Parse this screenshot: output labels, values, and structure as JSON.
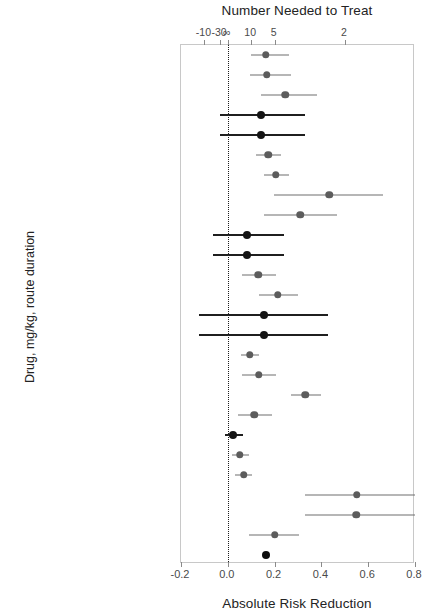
{
  "chart_data": {
    "type": "scatter",
    "subtype": "forest-plot",
    "title": "Number Needed to Treat",
    "xlabel": "Absolute Risk Reduction",
    "ylabel": "Drug, mg/kg, route duration",
    "top_axis_label": "Number Needed to Treat",
    "bottom_axis_label": "Absolute Risk Reduction",
    "xlim": [
      -0.2,
      0.8
    ],
    "bottom_ticks": [
      "-0.2",
      "0.0",
      "0.2",
      "0.4",
      "0.6",
      "0.8"
    ],
    "bottom_tick_values": [
      -0.2,
      0.0,
      0.2,
      0.4,
      0.6,
      0.8
    ],
    "top_ticks": [
      "-10",
      "-30",
      "∞",
      "10",
      "5",
      "2"
    ],
    "top_tick_values": [
      -0.1,
      -0.0333,
      0.0,
      0.1,
      0.2,
      0.5
    ],
    "grid": false,
    "legend": "none",
    "reference_line": 0.0,
    "reference_line_style": "dotted",
    "categories": [
      "Ceft Na, 2.2, IM 3 d (ET)",
      "Ceft Na, 1.1, IM 3 d (DRS1)",
      "Ceft Na, 2.2, IM 3 d (DRS1)",
      "Ceft Na, 1.1, IM 3 d (DRS2)",
      "Ceft Na, 2.2, IM 3 d (DRS2)",
      "Ceft Na, 1.1, IM 3 d (CT)",
      "Ceft Na, 2.2, IM 3 d (CT)",
      "Flor, 20, IM 48 h apart (ET)",
      "Flor, 20, IM 48 h apart (FS)",
      "Flor, 20, IM 48 h apart (DSSa)",
      "Flor, 40, SC once (DSSb)",
      "Flor, 40, SC once (DSSc)",
      "Flor, 40, SC once (DSSd)",
      "Enro, 2.5, SC daily 3-5 d (DRS)",
      "Enro, 5.0, SC daily 3-5 d (DRS)",
      "Enro, 2.5, SC daily 3-5 d (MLFS1)",
      "Enro, 5.0, SC daily 5 d (MLFS1)",
      "Enro, 7.5, SC once (MLFS2)",
      "Enro, 12.5, SC once (MLFS2)",
      "Dano, 6, IM 48 h apart (MLFS)",
      "Tula, 2.5, SC once (MLFS)",
      "Tild, 4, SC once (MLFS)",
      "Tula, 2.5, SC once (Kilgore et al)",
      "Til, 10, SC once (Kilgore et al)",
      "Flor, 20, IM 48 h apart (Booker et al)",
      "MEDIAN"
    ],
    "points": [
      {
        "label": "Ceft Na, 2.2, IM 3 d (ET)",
        "estimate": 0.163,
        "low": 0.1,
        "high": 0.262,
        "style": "grey"
      },
      {
        "label": "Ceft Na, 1.1, IM 3 d (DRS1)",
        "estimate": 0.166,
        "low": 0.093,
        "high": 0.272,
        "style": "grey"
      },
      {
        "label": "Ceft Na, 2.2, IM 3 d (DRS1)",
        "estimate": 0.245,
        "low": 0.144,
        "high": 0.38,
        "style": "grey"
      },
      {
        "label": "Ceft Na, 1.1, IM 3 d (DRS2)",
        "estimate": 0.142,
        "low": -0.035,
        "high": 0.332,
        "style": "black"
      },
      {
        "label": "Ceft Na, 2.2, IM 3 d (DRS2)",
        "estimate": 0.142,
        "low": -0.035,
        "high": 0.332,
        "style": "black"
      },
      {
        "label": "Ceft Na, 1.1, IM 3 d (CT)",
        "estimate": 0.172,
        "low": 0.12,
        "high": 0.228,
        "style": "grey"
      },
      {
        "label": "Ceft Na, 2.2, IM 3 d (CT)",
        "estimate": 0.204,
        "low": 0.153,
        "high": 0.262,
        "style": "grey"
      },
      {
        "label": "Flor, 20, IM 48 h apart (ET)",
        "estimate": 0.434,
        "low": 0.198,
        "high": 0.665,
        "style": "grey"
      },
      {
        "label": "Flor, 20, IM 48 h apart (FS)",
        "estimate": 0.31,
        "low": 0.153,
        "high": 0.465,
        "style": "grey"
      },
      {
        "label": "Flor, 20, IM 48 h apart (DSSa)",
        "estimate": 0.083,
        "low": -0.065,
        "high": 0.24,
        "style": "black"
      },
      {
        "label": "Flor, 40, SC once (DSSb)",
        "estimate": 0.083,
        "low": -0.065,
        "high": 0.24,
        "style": "black"
      },
      {
        "label": "Flor, 40, SC once (DSSc)",
        "estimate": 0.13,
        "low": 0.06,
        "high": 0.205,
        "style": "grey"
      },
      {
        "label": "Flor, 40, SC once (DSSd)",
        "estimate": 0.213,
        "low": 0.134,
        "high": 0.3,
        "style": "grey"
      },
      {
        "label": "Enro, 2.5, SC daily 3-5 d (DRS)",
        "estimate": 0.155,
        "low": -0.125,
        "high": 0.43,
        "style": "black"
      },
      {
        "label": "Enro, 5.0, SC daily 3-5 d (DRS)",
        "estimate": 0.155,
        "low": -0.125,
        "high": 0.43,
        "style": "black"
      },
      {
        "label": "Enro, 2.5, SC daily 3-5 d (MLFS1)",
        "estimate": 0.093,
        "low": 0.055,
        "high": 0.135,
        "style": "grey"
      },
      {
        "label": "Enro, 5.0, SC daily 5 d (MLFS1)",
        "estimate": 0.132,
        "low": 0.06,
        "high": 0.205,
        "style": "grey"
      },
      {
        "label": "Enro, 7.5, SC once (MLFS2)",
        "estimate": 0.33,
        "low": 0.268,
        "high": 0.398,
        "style": "grey"
      },
      {
        "label": "Enro, 12.5, SC once (MLFS2)",
        "estimate": 0.112,
        "low": 0.043,
        "high": 0.19,
        "style": "grey"
      },
      {
        "label": "Dano, 6, IM 48 h apart (MLFS)",
        "estimate": 0.022,
        "low": -0.01,
        "high": 0.065,
        "style": "black"
      },
      {
        "label": "Tula, 2.5, SC once (MLFS)",
        "estimate": 0.05,
        "low": 0.018,
        "high": 0.092,
        "style": "grey"
      },
      {
        "label": "Tild, 4, SC once (MLFS)",
        "estimate": 0.068,
        "low": 0.03,
        "high": 0.105,
        "style": "grey"
      },
      {
        "label": "Tula, 2.5, SC once (Kilgore et al)",
        "estimate": 0.55,
        "low": 0.33,
        "high": 0.8,
        "style": "grey"
      },
      {
        "label": "Til, 10, SC once (Kilgore et al)",
        "estimate": 0.548,
        "low": 0.328,
        "high": 0.8,
        "style": "grey"
      },
      {
        "label": "Flor, 20, IM 48 h apart (Booker et al)",
        "estimate": 0.2,
        "low": 0.092,
        "high": 0.306,
        "style": "grey"
      },
      {
        "label": "MEDIAN",
        "estimate": 0.165,
        "low": null,
        "high": null,
        "style": "median"
      }
    ]
  }
}
